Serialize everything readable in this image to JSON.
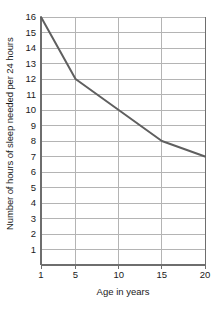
{
  "chart_data": {
    "type": "line",
    "title": "",
    "xlabel": "Age in years",
    "ylabel": "Number of hours of sleep needed per 24 hours",
    "xlim": [
      1,
      20
    ],
    "ylim": [
      0,
      16
    ],
    "grid": true,
    "legend": "none",
    "x_ticks": [
      1,
      5,
      10,
      15,
      20
    ],
    "x_tick_labels": [
      "1",
      "5",
      "10",
      "15",
      "20"
    ],
    "y_ticks": [
      1,
      2,
      3,
      4,
      5,
      6,
      7,
      8,
      9,
      10,
      11,
      12,
      13,
      14,
      15,
      16
    ],
    "y_tick_labels": [
      "1",
      "2",
      "3",
      "4",
      "5",
      "6",
      "7",
      "8",
      "9",
      "10",
      "11",
      "12",
      "13",
      "14",
      "15",
      "16"
    ],
    "x_gridlines": [
      5,
      10,
      15
    ],
    "series": [
      {
        "name": "Sleep needed",
        "color": "#5f5f5f",
        "x": [
          1,
          5,
          10,
          15,
          20
        ],
        "y": [
          16,
          12,
          10,
          8,
          7
        ]
      }
    ],
    "points": [
      {
        "x": 1,
        "y": 16
      },
      {
        "x": 5,
        "y": 12
      },
      {
        "x": 10,
        "y": 10
      },
      {
        "x": 15,
        "y": 8
      },
      {
        "x": 20,
        "y": 7
      }
    ]
  },
  "style": {
    "axis_color": "#6e6e6e",
    "grid_color": "#b4b4b4",
    "line_color": "#5f5f5f",
    "background": "#ffffff",
    "text_color": "#1a1a1a"
  }
}
